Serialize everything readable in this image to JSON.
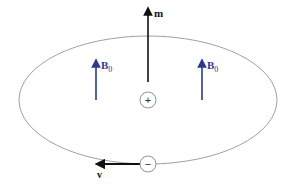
{
  "diagram": {
    "labels": {
      "magnetic_moment": "m",
      "field_left": "B",
      "field_left_sub": "0",
      "field_right": "B",
      "field_right_sub": "0",
      "nucleus_charge": "+",
      "electron_charge": "−",
      "velocity": "v"
    },
    "colors": {
      "field": "#2b3a8f",
      "moment": "#111111",
      "orbit": "#888888",
      "charge_circle": "#777777"
    }
  }
}
